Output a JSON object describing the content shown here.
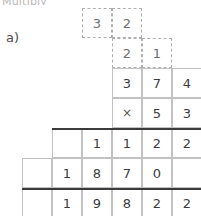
{
  "page": {
    "heading_cut": "Multiply",
    "item_label": "a)"
  },
  "worksheet": {
    "type": "long-multiplication",
    "multiplicand": "374",
    "multiplier": "53",
    "operator": "×",
    "carry_rows": [
      {
        "name": "carry-row-top",
        "start_col": 3,
        "digits": [
          "3",
          "2"
        ]
      },
      {
        "name": "carry-row-second",
        "start_col": 4,
        "digits": [
          "2",
          "1"
        ]
      }
    ],
    "grid_rows": [
      {
        "name": "multiplicand-row",
        "start_col": 4,
        "cells": [
          "3",
          "7",
          "4"
        ]
      },
      {
        "name": "multiplier-row",
        "start_col": 4,
        "cells": [
          "×",
          "5",
          "3"
        ]
      },
      {
        "name": "partial-product-1",
        "start_col": 2,
        "cells": [
          "",
          "1",
          "1",
          "2",
          "2"
        ]
      },
      {
        "name": "partial-product-2",
        "start_col": 1,
        "cells": [
          "",
          "1",
          "8",
          "7",
          "0",
          ""
        ]
      },
      {
        "name": "total-row",
        "start_col": 1,
        "cells": [
          "",
          "1",
          "9",
          "8",
          "2",
          "2"
        ]
      }
    ],
    "rules": [
      {
        "name": "rule-above-partials",
        "start_col": 2
      },
      {
        "name": "rule-above-total",
        "start_col": 1
      }
    ],
    "colors": {
      "cell_border": "#c2c2c2",
      "carry_border": "#b0b0b0",
      "rule": "#3b3b3b",
      "digit": "#3c3c3c"
    }
  }
}
